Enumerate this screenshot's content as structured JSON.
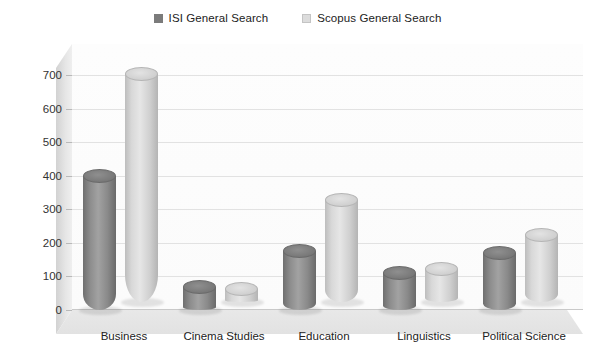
{
  "legend": {
    "position": "top-center",
    "items": [
      {
        "label": "ISI General Search",
        "color": "#7b7b7b"
      },
      {
        "label": "Scopus General Search",
        "color": "#d9d9d9"
      }
    ]
  },
  "chart_data": {
    "type": "bar",
    "style": "3d-cylinder",
    "title": "",
    "xlabel": "",
    "ylabel": "",
    "grid": true,
    "ylim": [
      0,
      700
    ],
    "yticks": [
      0,
      100,
      200,
      300,
      400,
      500,
      600,
      700
    ],
    "ytick_labels": [
      "0",
      "100",
      "200",
      "300",
      "400",
      "500",
      "600",
      "700"
    ],
    "categories": [
      "Business",
      "Cinema Studies",
      "Education",
      "Linguistics",
      "Political Science"
    ],
    "series": [
      {
        "name": "ISI General Search",
        "color": "#7b7b7b",
        "values": [
          400,
          70,
          175,
          110,
          170
        ]
      },
      {
        "name": "Scopus General Search",
        "color": "#d9d9d9",
        "values": [
          680,
          40,
          305,
          100,
          200
        ]
      }
    ]
  }
}
